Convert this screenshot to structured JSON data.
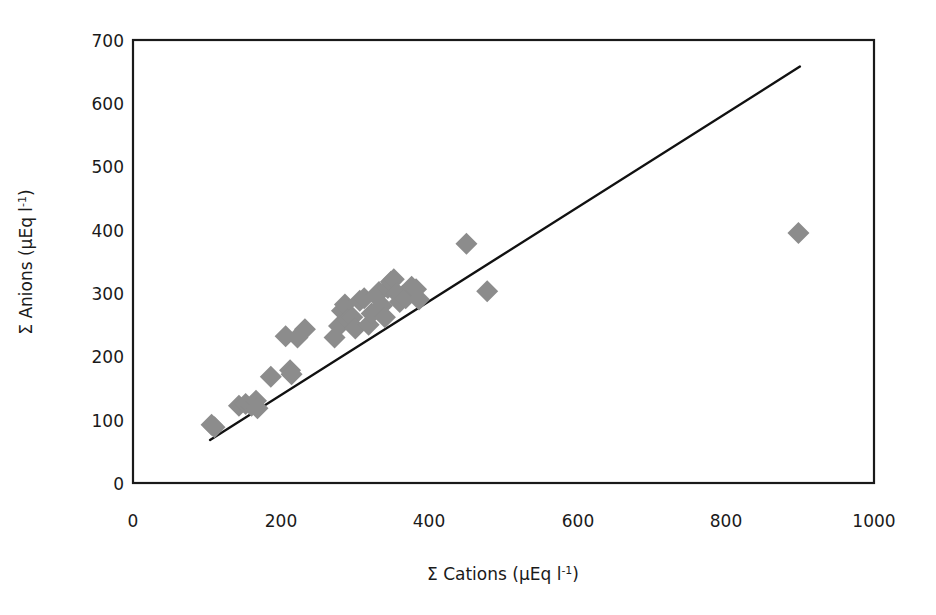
{
  "chart_data": {
    "type": "scatter",
    "title": "",
    "xlabel": "Σ Cations (μEq l⁻¹)",
    "ylabel": "Σ Anions (μEq l⁻¹)",
    "xlabel_parts": {
      "main": "Σ Cations (μEq l",
      "sup": "-1",
      "tail": ")"
    },
    "ylabel_parts": {
      "main": "Σ Anions (μEq l",
      "sup": "-1",
      "tail": ")"
    },
    "xlim": [
      0,
      1000
    ],
    "ylim": [
      0,
      700
    ],
    "xticks": [
      0,
      200,
      400,
      600,
      800,
      1000
    ],
    "yticks": [
      0,
      100,
      200,
      300,
      400,
      500,
      600,
      700
    ],
    "xtick_labels": [
      "0",
      "200",
      "400",
      "600",
      "800",
      "1000"
    ],
    "ytick_labels": [
      "0",
      "100",
      "200",
      "300",
      "400",
      "500",
      "600",
      "700"
    ],
    "grid": false,
    "legend": null,
    "marker_shape": "diamond",
    "marker_color": "#8c8c8c",
    "marker_size": 11,
    "line_color": "#111111",
    "frame_color": "#1a1a1a",
    "background": "#ffffff",
    "series": [
      {
        "name": "samples",
        "points": [
          [
            106,
            92
          ],
          [
            110,
            88
          ],
          [
            143,
            122
          ],
          [
            152,
            125
          ],
          [
            160,
            122
          ],
          [
            166,
            130
          ],
          [
            168,
            118
          ],
          [
            186,
            168
          ],
          [
            206,
            232
          ],
          [
            212,
            178
          ],
          [
            214,
            172
          ],
          [
            222,
            230
          ],
          [
            232,
            243
          ],
          [
            272,
            230
          ],
          [
            278,
            248
          ],
          [
            282,
            272
          ],
          [
            286,
            282
          ],
          [
            290,
            258
          ],
          [
            296,
            262
          ],
          [
            300,
            244
          ],
          [
            306,
            288
          ],
          [
            312,
            292
          ],
          [
            318,
            250
          ],
          [
            322,
            268
          ],
          [
            328,
            296
          ],
          [
            332,
            302
          ],
          [
            336,
            280
          ],
          [
            340,
            262
          ],
          [
            344,
            308
          ],
          [
            348,
            318
          ],
          [
            352,
            322
          ],
          [
            356,
            300
          ],
          [
            360,
            286
          ],
          [
            364,
            296
          ],
          [
            368,
            292
          ],
          [
            376,
            310
          ],
          [
            382,
            306
          ],
          [
            386,
            290
          ],
          [
            450,
            378
          ],
          [
            478,
            303
          ],
          [
            898,
            395
          ]
        ]
      }
    ],
    "trendline": {
      "type": "linear",
      "x_start": 104,
      "y_start": 68,
      "x_end": 900,
      "y_end": 658,
      "slope": 0.741,
      "intercept": -9.0
    }
  },
  "axes": {
    "x_axis_name": "sigma-cations-axis",
    "y_axis_name": "sigma-anions-axis"
  }
}
